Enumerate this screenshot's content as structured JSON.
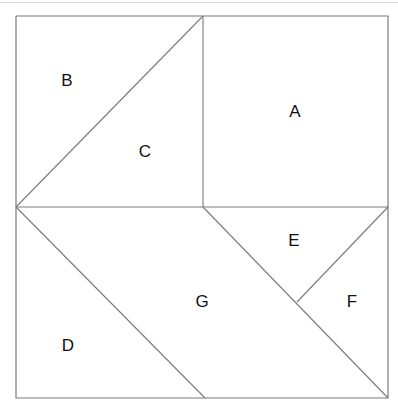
{
  "figure": {
    "background_color": "#ffffff",
    "line_color": "#7a7a7a",
    "label_color": "#111111",
    "top_rule_color": "#d8d8d8",
    "frame": {
      "x0": 16,
      "y0": 16,
      "x1": 388,
      "y1": 398
    },
    "vertices": {
      "top_left": [
        16,
        16
      ],
      "top_mid": [
        203,
        16
      ],
      "top_right": [
        388,
        16
      ],
      "left_mid": [
        16,
        207
      ],
      "center_mid": [
        203,
        207
      ],
      "right_mid": [
        388,
        207
      ],
      "ef_junction": [
        297,
        302
      ],
      "bottom_left": [
        16,
        398
      ],
      "bottom_mid": [
        205,
        398
      ],
      "bottom_right": [
        388,
        398
      ]
    },
    "edges": [
      {
        "name": "outer-frame-rectangle",
        "points": "16,16 388,16 388,398 16,398 16,16"
      },
      {
        "name": "horizontal-midline",
        "points": "16,207 388,207"
      },
      {
        "name": "vertical-divider-a-c",
        "points": "203,16 203,207"
      },
      {
        "name": "diagonal-b-c",
        "points": "16,207 203,16"
      },
      {
        "name": "diagonal-d-g",
        "points": "16,207 205,398"
      },
      {
        "name": "diagonal-g-ef",
        "points": "203,207 388,398"
      },
      {
        "name": "diagonal-e-f",
        "points": "388,207 297,302"
      }
    ],
    "pieces": [
      {
        "id": "A",
        "label": "A",
        "shape": "square",
        "polygon": "203,16 388,16 388,207 203,207",
        "label_pos": [
          295,
          113
        ]
      },
      {
        "id": "B",
        "label": "B",
        "shape": "triangle",
        "polygon": "16,16 203,16 16,207",
        "label_pos": [
          67,
          82
        ]
      },
      {
        "id": "C",
        "label": "C",
        "shape": "triangle",
        "polygon": "203,16 203,207 16,207",
        "label_pos": [
          145,
          153
        ]
      },
      {
        "id": "D",
        "label": "D",
        "shape": "triangle",
        "polygon": "16,207 205,398 16,398",
        "label_pos": [
          68,
          347
        ]
      },
      {
        "id": "E",
        "label": "E",
        "shape": "triangle",
        "polygon": "203,207 388,207 297,302",
        "label_pos": [
          294,
          242
        ]
      },
      {
        "id": "F",
        "label": "F",
        "shape": "triangle",
        "polygon": "388,207 388,398 297,302",
        "label_pos": [
          352,
          303
        ]
      },
      {
        "id": "G",
        "label": "G",
        "shape": "quadrilateral",
        "polygon": "16,207 203,207 388,398 205,398",
        "label_pos": [
          202,
          303
        ]
      }
    ]
  }
}
